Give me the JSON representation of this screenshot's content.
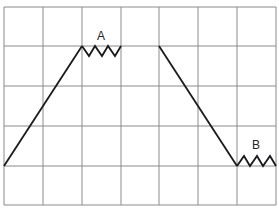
{
  "diagram": {
    "type": "waveform-on-grid",
    "grid": {
      "columns": 7,
      "rows": 5,
      "x_lines": [
        4,
        43,
        82,
        121,
        159,
        198,
        237,
        276
      ],
      "y_lines": [
        7,
        46,
        86,
        126,
        166,
        205
      ],
      "color": "#8a8a8a"
    },
    "trace_color": "#1a1a1a",
    "segments": [
      {
        "name": "rise",
        "points": [
          [
            4,
            166
          ],
          [
            82,
            46
          ]
        ]
      },
      {
        "name": "zigzag-A",
        "points": [
          [
            82,
            46
          ],
          [
            89,
            56
          ],
          [
            95,
            46
          ],
          [
            102,
            56
          ],
          [
            108,
            46
          ],
          [
            115,
            56
          ],
          [
            121,
            46
          ]
        ]
      },
      {
        "name": "fall",
        "points": [
          [
            159,
            46
          ],
          [
            237,
            166
          ]
        ]
      },
      {
        "name": "zigzag-B",
        "points": [
          [
            237,
            166
          ],
          [
            244,
            156
          ],
          [
            250,
            166
          ],
          [
            257,
            156
          ],
          [
            263,
            166
          ],
          [
            270,
            156
          ],
          [
            276,
            166
          ]
        ]
      }
    ],
    "labels": [
      {
        "text": "A",
        "x": 101,
        "y": 40
      },
      {
        "text": "B",
        "x": 256,
        "y": 149
      }
    ]
  }
}
